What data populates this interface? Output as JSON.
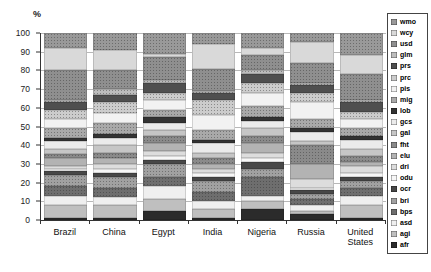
{
  "chart_data": {
    "type": "bar",
    "stacked": true,
    "title": "",
    "xlabel": "",
    "ylabel": "%",
    "ylim": [
      0,
      100
    ],
    "yticks": [
      0,
      10,
      20,
      30,
      40,
      50,
      60,
      70,
      80,
      90,
      100
    ],
    "grid": true,
    "legend_position": "right",
    "categories": [
      "Brazil",
      "China",
      "Egypt",
      "India",
      "Nigeria",
      "Russia",
      "United States"
    ],
    "series": [
      {
        "name": "wmo",
        "color": "#999999",
        "texture": "dotted",
        "values": [
          8,
          9,
          11,
          6,
          8,
          5,
          12
        ]
      },
      {
        "name": "wcy",
        "color": "#d9d9d9",
        "texture": "solid",
        "values": [
          12,
          11,
          2,
          13,
          4,
          11,
          10
        ]
      },
      {
        "name": "usd",
        "color": "#8f8f8f",
        "texture": "dotted",
        "values": [
          16,
          10,
          12,
          12,
          8,
          11,
          14
        ]
      },
      {
        "name": "glm",
        "color": "#bdbdbd",
        "texture": "dotted",
        "values": [
          1,
          3,
          2,
          1,
          2,
          1,
          1
        ]
      },
      {
        "name": "prs",
        "color": "#4f4f4f",
        "texture": "solid",
        "values": [
          4,
          4,
          5,
          4,
          5,
          4,
          5
        ]
      },
      {
        "name": "prc",
        "color": "#cccccc",
        "texture": "dotted",
        "values": [
          5,
          6,
          4,
          8,
          5,
          5,
          4
        ]
      },
      {
        "name": "pis",
        "color": "#f2f2f2",
        "texture": "solid",
        "values": [
          5,
          5,
          5,
          8,
          7,
          9,
          5
        ]
      },
      {
        "name": "mig",
        "color": "#a9a9a9",
        "texture": "dotted",
        "values": [
          5,
          6,
          4,
          5,
          6,
          5,
          4
        ]
      },
      {
        "name": "lob",
        "color": "#333333",
        "texture": "solid",
        "values": [
          2,
          2,
          3,
          2,
          2,
          2,
          2
        ]
      },
      {
        "name": "gcs",
        "color": "#ebebeb",
        "texture": "solid",
        "values": [
          4,
          4,
          4,
          5,
          4,
          5,
          5
        ]
      },
      {
        "name": "gal",
        "color": "#c6c6c6",
        "texture": "solid",
        "values": [
          3,
          4,
          3,
          3,
          4,
          2,
          4
        ]
      },
      {
        "name": "fht",
        "color": "#8a8a8a",
        "texture": "dotted",
        "values": [
          2,
          3,
          4,
          3,
          4,
          10,
          3
        ]
      },
      {
        "name": "elu",
        "color": "#b3b3b3",
        "texture": "solid",
        "values": [
          4,
          3,
          4,
          3,
          5,
          8,
          2
        ]
      },
      {
        "name": "dri",
        "color": "#dddddd",
        "texture": "solid",
        "values": [
          2,
          3,
          3,
          2,
          3,
          5,
          4
        ]
      },
      {
        "name": "odu",
        "color": "#f7f7f7",
        "texture": "solid",
        "values": [
          1,
          2,
          2,
          2,
          2,
          1,
          2
        ]
      },
      {
        "name": "ocr",
        "color": "#474747",
        "texture": "solid",
        "values": [
          2,
          2,
          2,
          2,
          4,
          2,
          2
        ]
      },
      {
        "name": "bri",
        "color": "#a1a1a1",
        "texture": "dotted",
        "values": [
          6,
          6,
          7,
          6,
          4,
          3,
          4
        ]
      },
      {
        "name": "bps",
        "color": "#6e6e6e",
        "texture": "dotted",
        "values": [
          5,
          5,
          5,
          5,
          10,
          3,
          4
        ]
      },
      {
        "name": "asd",
        "color": "#efefef",
        "texture": "solid",
        "values": [
          5,
          4,
          7,
          4,
          3,
          3,
          5
        ]
      },
      {
        "name": "agi",
        "color": "#bfbfbf",
        "texture": "solid",
        "values": [
          7,
          7,
          6,
          5,
          4,
          2,
          7
        ]
      },
      {
        "name": "afr",
        "color": "#2b2b2b",
        "texture": "solid",
        "values": [
          1,
          1,
          5,
          1,
          6,
          3,
          1
        ]
      }
    ]
  }
}
